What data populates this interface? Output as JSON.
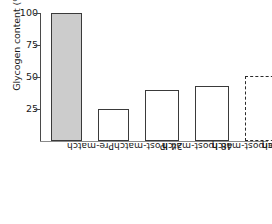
{
  "chart_data": {
    "type": "bar",
    "title": "",
    "xlabel": "",
    "ylabel": "Glycogen content (%)",
    "ylim": [
      0,
      100
    ],
    "yticks": [
      25,
      50,
      75,
      100
    ],
    "grid": false,
    "legend": "none",
    "categories": [
      "Pre-match",
      "Post-match",
      "24 h post-match",
      "48 h post-match",
      "Pre European Cup match"
    ],
    "values": [
      100,
      25,
      40,
      43,
      51
    ],
    "bars": [
      {
        "label_line1": "Pre-match",
        "label_line2": "",
        "value": 100,
        "style": "solid",
        "fill": "#cccccc"
      },
      {
        "label_line1": "Post-match",
        "label_line2": "",
        "value": 25,
        "style": "solid",
        "fill": "#ffffff"
      },
      {
        "label_line1": "24 h",
        "label_line2": "post-match",
        "value": 40,
        "style": "solid",
        "fill": "#ffffff"
      },
      {
        "label_line1": "48 h",
        "label_line2": "post-match",
        "value": 43,
        "style": "solid",
        "fill": "#ffffff"
      },
      {
        "label_line1": "Pre European",
        "label_line2": "Cup match",
        "value": 51,
        "style": "dashed",
        "fill": "#ffffff"
      }
    ]
  },
  "axis": {
    "tick_100": "100",
    "tick_75": "75",
    "tick_50": "50",
    "tick_25": "25"
  },
  "colors": {
    "bar_outline": "#3a3a3a",
    "bar_fill_highlight": "#cccccc",
    "axis": "#4a4a4a",
    "text": "#1a1a1a"
  }
}
